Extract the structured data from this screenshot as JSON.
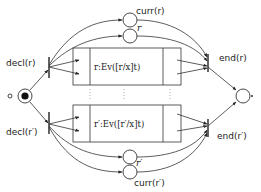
{
  "diagram": {
    "type": "petri-net",
    "nodes": {
      "start_place": {
        "label": "",
        "marked": true
      },
      "start_marker": {
        "label": "◇"
      },
      "decl_r": {
        "label": "decl(r)",
        "kind": "transition"
      },
      "decl_r_prime": {
        "label": "decl(r′)",
        "kind": "transition"
      },
      "curr_r": {
        "label": "curr(r)",
        "kind": "place"
      },
      "r_place": {
        "label": "r",
        "kind": "place"
      },
      "r_prime_place": {
        "label": "r′",
        "kind": "place"
      },
      "curr_r_prime": {
        "label": "curr(r′)",
        "kind": "place"
      },
      "box_r": {
        "label": "r:Ev([r/x]t)",
        "kind": "subnet"
      },
      "box_r_prime": {
        "label": "r′:Ev([r′/x]t)",
        "kind": "subnet"
      },
      "end_r": {
        "label": "end(r)",
        "kind": "transition"
      },
      "end_r_prime": {
        "label": "end(r′)",
        "kind": "transition"
      },
      "end_place": {
        "label": "",
        "kind": "place"
      }
    },
    "ellipsis": "⋮"
  }
}
